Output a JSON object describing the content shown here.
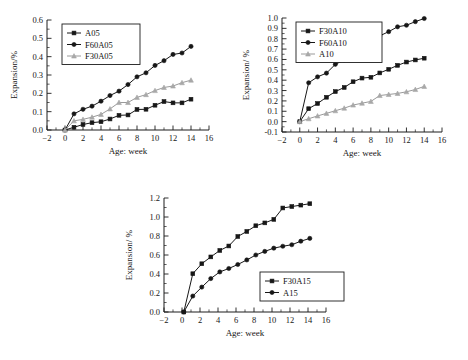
{
  "figure": {
    "background": "#ffffff",
    "panel_count": 3,
    "colors": {
      "dark": "#171717",
      "grey": "#a8a8a8",
      "axis": "#1c1c1c"
    }
  },
  "chart_data": [
    {
      "id": "panel-a",
      "type": "line",
      "title": "",
      "xlabel": "Age: week",
      "ylabel": "Expansion/%",
      "xlim": [
        -2,
        16
      ],
      "ylim": [
        0.0,
        0.6
      ],
      "xticks": [
        -2,
        0,
        2,
        4,
        6,
        8,
        10,
        12,
        14,
        16
      ],
      "xticklabels": [
        "−2",
        "0",
        "2",
        "4",
        "6",
        "8",
        "10",
        "12",
        "14",
        "16"
      ],
      "yticks": [
        0.0,
        0.1,
        0.2,
        0.3,
        0.4,
        0.5,
        0.6
      ],
      "yticklabels": [
        "0.0",
        "0.1",
        "0.2",
        "0.3",
        "0.4",
        "0.5",
        "0.6"
      ],
      "grid": false,
      "legend_position": "upper-left",
      "x": [
        0,
        1,
        2,
        3,
        4,
        5,
        6,
        7,
        8,
        9,
        10,
        11,
        12,
        13,
        14
      ],
      "series": [
        {
          "name": "A05",
          "marker": "square",
          "color": "#171717",
          "values": [
            0.0,
            0.015,
            0.03,
            0.04,
            0.045,
            0.06,
            0.08,
            0.082,
            0.112,
            0.113,
            0.135,
            0.155,
            0.148,
            0.148,
            0.168
          ]
        },
        {
          "name": "F60A05",
          "marker": "circle",
          "color": "#171717",
          "values": [
            0.0,
            0.088,
            0.113,
            0.13,
            0.157,
            0.188,
            0.212,
            0.248,
            0.29,
            0.312,
            0.352,
            0.378,
            0.412,
            0.42,
            0.456
          ]
        },
        {
          "name": "F30A05",
          "marker": "triangle",
          "color": "#a8a8a8",
          "values": [
            0.0,
            0.05,
            0.058,
            0.07,
            0.085,
            0.115,
            0.15,
            0.15,
            0.178,
            0.193,
            0.215,
            0.232,
            0.24,
            0.258,
            0.272
          ]
        }
      ]
    },
    {
      "id": "panel-b",
      "type": "line",
      "title": "",
      "xlabel": "Age: week",
      "ylabel": "Expansion/ %",
      "xlim": [
        -2,
        16
      ],
      "ylim": [
        -0.1,
        1.0
      ],
      "xticks": [
        -2,
        0,
        2,
        4,
        6,
        8,
        10,
        12,
        14,
        16
      ],
      "xticklabels": [
        "−2",
        "0",
        "2",
        "4",
        "6",
        "8",
        "10",
        "12",
        "14",
        "16"
      ],
      "yticks": [
        -0.1,
        0.0,
        0.1,
        0.2,
        0.3,
        0.4,
        0.5,
        0.6,
        0.7,
        0.8,
        0.9,
        1.0
      ],
      "yticklabels": [
        "-0.1",
        "0.0",
        "0.1",
        "0.2",
        "0.3",
        "0.4",
        "0.5",
        "0.6",
        "0.7",
        "0.8",
        "0.9",
        "1.0"
      ],
      "grid": false,
      "legend_position": "upper-left",
      "x": [
        0,
        1,
        2,
        3,
        4,
        5,
        6,
        7,
        8,
        9,
        10,
        11,
        12,
        13,
        14
      ],
      "series": [
        {
          "name": "F30A10",
          "marker": "square",
          "color": "#171717",
          "values": [
            0.0,
            0.125,
            0.175,
            0.235,
            0.29,
            0.33,
            0.385,
            0.42,
            0.428,
            0.47,
            0.505,
            0.543,
            0.575,
            0.595,
            0.612
          ]
        },
        {
          "name": "F60A10",
          "marker": "circle",
          "color": "#171717",
          "values": [
            0.0,
            0.375,
            0.432,
            0.468,
            0.553,
            0.595,
            0.648,
            0.742,
            0.768,
            0.828,
            0.868,
            0.915,
            0.93,
            0.965,
            0.995
          ]
        },
        {
          "name": "A10",
          "marker": "triangle",
          "color": "#a8a8a8",
          "values": [
            0.0,
            0.028,
            0.055,
            0.08,
            0.105,
            0.13,
            0.16,
            0.178,
            0.195,
            0.252,
            0.262,
            0.272,
            0.288,
            0.31,
            0.34
          ]
        }
      ]
    },
    {
      "id": "panel-c",
      "type": "line",
      "title": "",
      "xlabel": "Age: week",
      "ylabel": "Expansion/ %",
      "xlim": [
        -2,
        16
      ],
      "ylim": [
        0.0,
        1.2
      ],
      "xticks": [
        -2,
        0,
        2,
        4,
        6,
        8,
        10,
        12,
        14,
        16
      ],
      "xticklabels": [
        "−2",
        "0",
        "2",
        "4",
        "6",
        "8",
        "10",
        "12",
        "14",
        "16"
      ],
      "yticks": [
        0.0,
        0.2,
        0.4,
        0.6,
        0.8,
        1.0,
        1.2
      ],
      "yticklabels": [
        "0.0",
        "0.2",
        "0.4",
        "0.6",
        "0.8",
        "1.0",
        "1.2"
      ],
      "grid": false,
      "legend_position": "lower-right",
      "x": [
        0.2,
        1.2,
        2.2,
        3.2,
        4.2,
        5.2,
        6.2,
        7.2,
        8.2,
        9.2,
        10.2,
        11.2,
        12.2,
        13.2,
        14.2
      ],
      "series": [
        {
          "name": "F30A15",
          "marker": "square",
          "color": "#171717",
          "values": [
            0.0,
            0.403,
            0.508,
            0.58,
            0.648,
            0.695,
            0.795,
            0.848,
            0.908,
            0.938,
            0.975,
            1.095,
            1.11,
            1.125,
            1.14
          ]
        },
        {
          "name": "A15",
          "marker": "circle",
          "color": "#171717",
          "values": [
            0.0,
            0.168,
            0.262,
            0.352,
            0.422,
            0.458,
            0.5,
            0.548,
            0.6,
            0.638,
            0.672,
            0.692,
            0.708,
            0.745,
            0.775
          ]
        }
      ]
    }
  ]
}
